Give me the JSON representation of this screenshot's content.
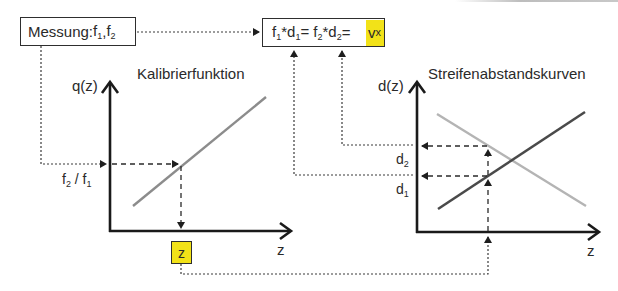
{
  "measurement_box": {
    "label": "Messung: ",
    "f1": "f",
    "f1_sub": "1",
    "sep": ",",
    "f2": "f",
    "f2_sub": "2"
  },
  "equation_box": {
    "t1": "f",
    "t1_sub": "1",
    "t2": "*d",
    "t2_sub": "1",
    "t3": " = f",
    "t3_sub": "2",
    "t4": "*d",
    "t4_sub": "2",
    "t5": "= ",
    "result": "v",
    "result_sub": "x",
    "highlight_color": "#f2e218"
  },
  "left_chart": {
    "title": "Kalibrierfunktion",
    "y_label": "q(z)",
    "x_label": "z",
    "ratio_label_num": "f",
    "ratio_label_num_sub": "2",
    "ratio_label_sep": " / ",
    "ratio_label_den": "f",
    "ratio_label_den_sub": "1",
    "result_box": "z",
    "line_color": "#8c8c8c"
  },
  "right_chart": {
    "title": "Streifenabstandskurven",
    "y_label": "d(z)",
    "x_label": "z",
    "d2_label": "d",
    "d2_sub": "2",
    "d1_label": "d",
    "d1_sub": "1",
    "rising_line_color": "#4a4a4a",
    "falling_line_color": "#b4b4b4"
  },
  "colors": {
    "axis": "#1a1a1a",
    "highlight": "#f2e218",
    "connector": "#3a3a3a"
  }
}
